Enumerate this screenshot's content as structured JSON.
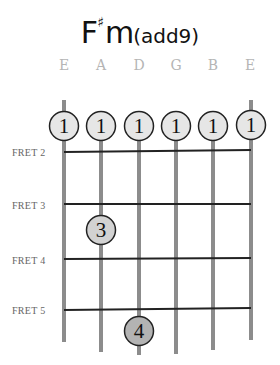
{
  "chord": {
    "root": "F",
    "accidental": "♯",
    "quality": "m",
    "suffix": "(add9)"
  },
  "strings": [
    {
      "name": "E",
      "x": 64
    },
    {
      "name": "A",
      "x": 101
    },
    {
      "name": "D",
      "x": 139
    },
    {
      "name": "G",
      "x": 176
    },
    {
      "name": "B",
      "x": 213
    },
    {
      "name": "E",
      "x": 250
    }
  ],
  "fret_labels": [
    {
      "label": "FRET 2",
      "y": 152
    },
    {
      "label": "FRET 3",
      "y": 205
    },
    {
      "label": "FRET 4",
      "y": 260
    },
    {
      "label": "FRET 5",
      "y": 310
    }
  ],
  "fingers": [
    {
      "string": 1,
      "finger": "1",
      "role": "barre"
    },
    {
      "string": 2,
      "finger": "1",
      "role": "barre"
    },
    {
      "string": 3,
      "finger": "1",
      "role": "barre"
    },
    {
      "string": 4,
      "finger": "1",
      "role": "barre"
    },
    {
      "string": 5,
      "finger": "1",
      "role": "barre"
    },
    {
      "string": 6,
      "finger": "1",
      "role": "barre"
    },
    {
      "string": 2,
      "finger": "3",
      "fret": 3
    },
    {
      "string": 3,
      "finger": "4",
      "fret": 5
    }
  ],
  "colors": {
    "string": "#8c8c8c",
    "fret": "#222222",
    "dot_light": "#e6e6e6",
    "dot_dark": "#b3b3b3",
    "string_name": "#b5b5b5"
  }
}
